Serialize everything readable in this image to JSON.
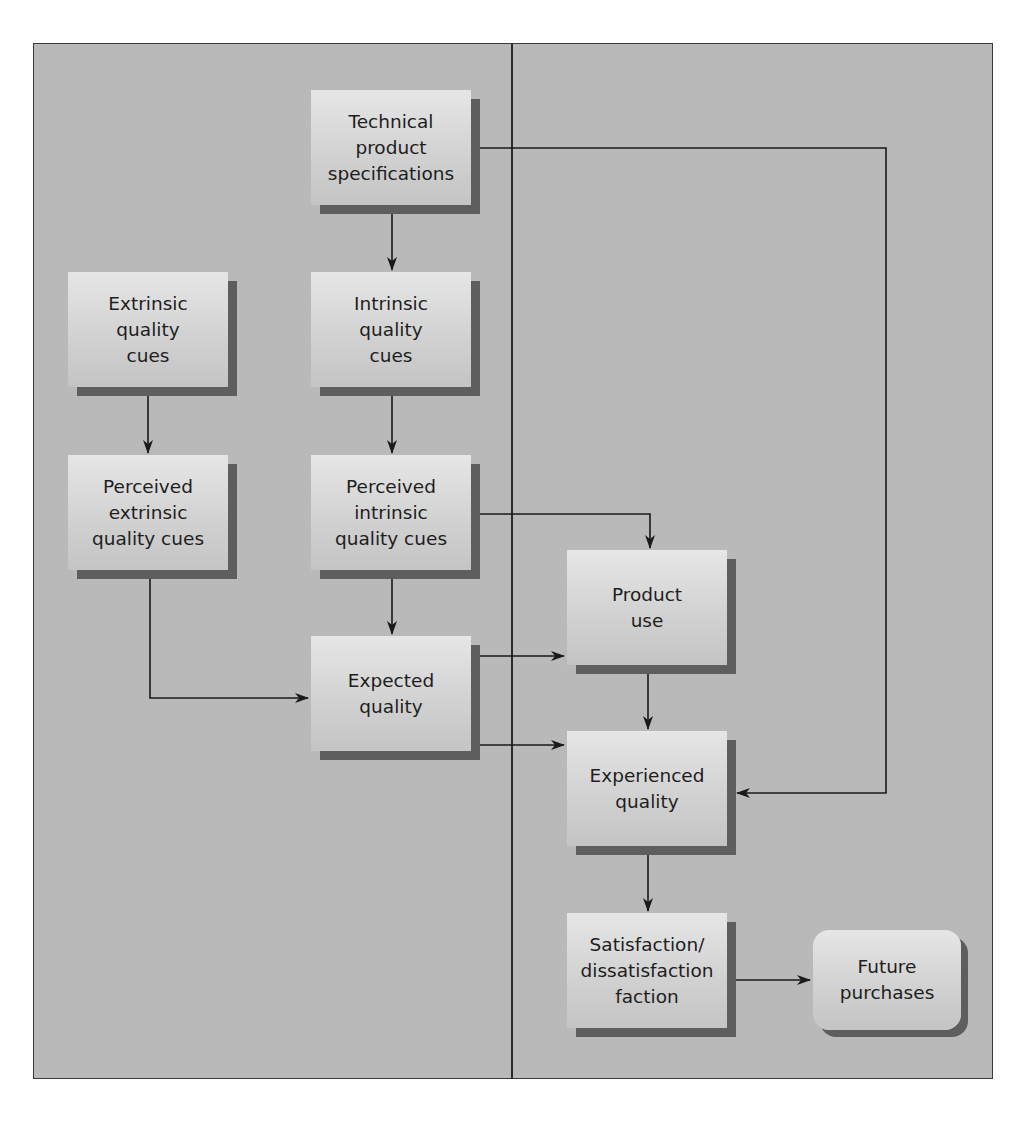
{
  "diagram": {
    "type": "flowchart",
    "colors": {
      "background": "#b9b9b9",
      "box_fill": "#d6d6d6",
      "box_shadow": "#5e5e5e",
      "line": "#1a1a1a",
      "text": "#1e1e1e"
    },
    "nodes": {
      "technical": {
        "label": "Technical\nproduct\nspecifications"
      },
      "extrinsic": {
        "label": "Extrinsic\nquality\ncues"
      },
      "intrinsic": {
        "label": "Intrinsic\nquality\ncues"
      },
      "perceived_extrinsic": {
        "label": "Perceived\nextrinsic\nquality cues"
      },
      "perceived_intrinsic": {
        "label": "Perceived\nintrinsic\nquality cues"
      },
      "expected": {
        "label": "Expected\nquality"
      },
      "product_use": {
        "label": "Product\nuse"
      },
      "experienced": {
        "label": "Experienced\nquality"
      },
      "satisfaction": {
        "label": "Satisfaction/\ndissatisfaction\nfaction"
      },
      "future": {
        "label": "Future\npurchases"
      }
    },
    "edges": [
      {
        "from": "technical",
        "to": "intrinsic"
      },
      {
        "from": "technical",
        "to": "experienced"
      },
      {
        "from": "extrinsic",
        "to": "perceived_extrinsic"
      },
      {
        "from": "intrinsic",
        "to": "perceived_intrinsic"
      },
      {
        "from": "perceived_extrinsic",
        "to": "expected"
      },
      {
        "from": "perceived_intrinsic",
        "to": "expected"
      },
      {
        "from": "perceived_intrinsic",
        "to": "product_use"
      },
      {
        "from": "expected",
        "to": "product_use"
      },
      {
        "from": "expected",
        "to": "experienced"
      },
      {
        "from": "product_use",
        "to": "experienced"
      },
      {
        "from": "experienced",
        "to": "satisfaction"
      },
      {
        "from": "satisfaction",
        "to": "future"
      }
    ]
  }
}
